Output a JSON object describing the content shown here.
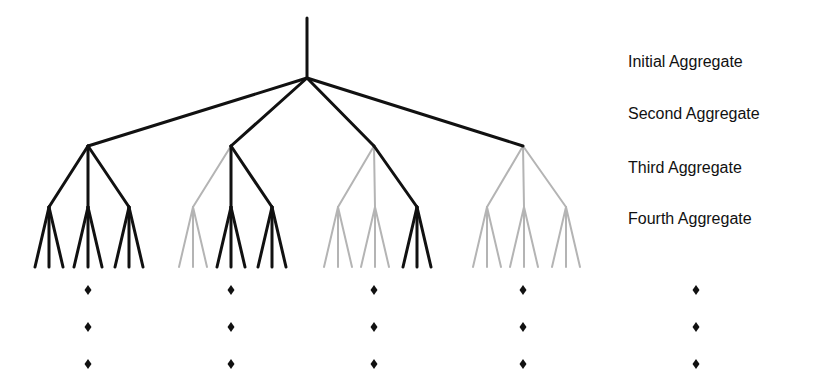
{
  "diagram": {
    "colors": {
      "active": "#111111",
      "inactive": "#b4b4b4"
    },
    "levels": [
      {
        "label": "Initial Aggregate",
        "y": 63
      },
      {
        "label": "Second Aggregate",
        "y": 115
      },
      {
        "label": "Third Aggregate",
        "y": 169
      },
      {
        "label": "Fourth Aggregate",
        "y": 220
      }
    ],
    "root": {
      "x": 307,
      "top": 18,
      "y": 78
    },
    "second_level_y": 146,
    "third_level_y": 207,
    "leaf_y": 267,
    "leaf_spread": 14,
    "groups": [
      {
        "x": 88,
        "active": true,
        "children": [
          {
            "x": 49,
            "active": true
          },
          {
            "x": 88,
            "active": true
          },
          {
            "x": 129,
            "active": true
          }
        ]
      },
      {
        "x": 231,
        "active": true,
        "children": [
          {
            "x": 193,
            "active": false
          },
          {
            "x": 231,
            "active": true
          },
          {
            "x": 272,
            "active": true
          }
        ]
      },
      {
        "x": 374,
        "active": true,
        "children": [
          {
            "x": 338,
            "active": false
          },
          {
            "x": 375,
            "active": false
          },
          {
            "x": 417,
            "active": true
          }
        ]
      },
      {
        "x": 523,
        "active": true,
        "children": [
          {
            "x": 487,
            "active": false
          },
          {
            "x": 524,
            "active": false
          },
          {
            "x": 566,
            "active": false
          }
        ]
      }
    ],
    "second_to_third_active": [
      [
        true,
        true,
        true
      ],
      [
        false,
        true,
        true
      ],
      [
        false,
        false,
        true
      ],
      [
        false,
        false,
        false
      ]
    ],
    "ellipsis": {
      "columns_x": [
        88,
        231,
        374,
        523,
        696
      ],
      "rows_y": [
        290,
        327,
        364
      ],
      "glyph": "♦"
    }
  }
}
